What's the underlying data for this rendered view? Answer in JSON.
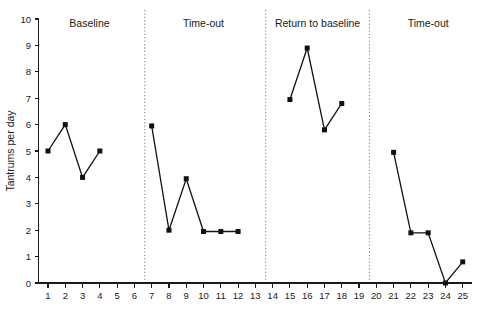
{
  "chart_data": {
    "type": "line",
    "title": "",
    "xlabel": "",
    "ylabel": "Tantrums per day",
    "xlim": [
      0.2,
      25.8
    ],
    "ylim": [
      0,
      10
    ],
    "grid": false,
    "legend": "none",
    "x_ticks": [
      1,
      2,
      3,
      4,
      5,
      6,
      7,
      8,
      9,
      10,
      11,
      12,
      13,
      14,
      15,
      16,
      17,
      18,
      19,
      20,
      21,
      22,
      23,
      24,
      25
    ],
    "y_ticks": [
      0,
      1,
      2,
      3,
      4,
      5,
      6,
      7,
      8,
      9,
      10
    ],
    "marker": "square",
    "phase_dividers": [
      6.6,
      13.6,
      19.6
    ],
    "phases": [
      {
        "label": "Baseline",
        "label_x": 3.4,
        "x": [
          1,
          2,
          3,
          4
        ],
        "y": [
          5,
          6,
          4,
          5
        ]
      },
      {
        "label": "Time-out",
        "label_x": 10.0,
        "x": [
          7,
          8,
          9,
          10,
          11,
          12
        ],
        "y": [
          5.95,
          2,
          3.95,
          1.95,
          1.95,
          1.95
        ]
      },
      {
        "label": "Return to baseline",
        "label_x": 16.6,
        "x": [
          15,
          16,
          17,
          18
        ],
        "y": [
          6.95,
          8.9,
          5.8,
          6.8
        ]
      },
      {
        "label": "Time-out",
        "label_x": 23.0,
        "x": [
          21,
          22,
          23,
          24,
          25
        ],
        "y": [
          4.95,
          1.9,
          1.9,
          0,
          0.8
        ]
      }
    ]
  }
}
